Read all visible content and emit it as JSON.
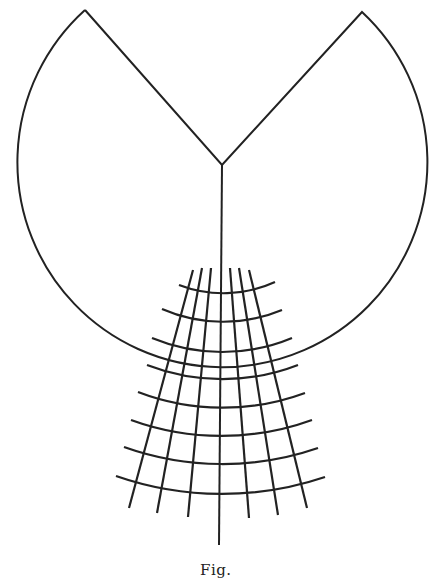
{
  "figure": {
    "caption": "Fig.",
    "stroke_color": "#222222",
    "background": "#ffffff",
    "sector": {
      "center": [
        222,
        165
      ],
      "radius": 205,
      "left_tip": [
        85,
        10
      ],
      "right_tip": [
        362,
        12
      ],
      "stem_end": [
        219,
        545
      ]
    },
    "grid": {
      "focus": [
        219,
        170
      ],
      "arcs": [
        {
          "r": 124,
          "left": [
            179,
            285
          ],
          "right": [
            275,
            282
          ]
        },
        {
          "r": 153,
          "left": [
            162,
            309
          ],
          "right": [
            282,
            310
          ]
        },
        {
          "r": 182,
          "left": [
            152,
            338
          ],
          "right": [
            292,
            338
          ]
        },
        {
          "r": 209,
          "left": [
            147,
            365
          ],
          "right": [
            298,
            365
          ]
        },
        {
          "r": 237,
          "left": [
            138,
            392
          ],
          "right": [
            305,
            393
          ]
        },
        {
          "r": 265,
          "left": [
            131,
            420
          ],
          "right": [
            312,
            420
          ]
        },
        {
          "r": 293,
          "left": [
            124,
            447
          ],
          "right": [
            318,
            448
          ]
        },
        {
          "r": 322,
          "left": [
            116,
            476
          ],
          "right": [
            325,
            477
          ]
        }
      ],
      "rays": [
        {
          "top": [
            193,
            270
          ],
          "bottom": [
            129,
            508
          ]
        },
        {
          "top": [
            202,
            268
          ],
          "bottom": [
            157,
            513
          ]
        },
        {
          "top": [
            211,
            268
          ],
          "bottom": [
            188,
            517
          ]
        },
        {
          "top": [
            230,
            268
          ],
          "bottom": [
            249,
            518
          ]
        },
        {
          "top": [
            239,
            268
          ],
          "bottom": [
            278,
            515
          ]
        },
        {
          "top": [
            249,
            270
          ],
          "bottom": [
            307,
            508
          ]
        }
      ]
    }
  }
}
